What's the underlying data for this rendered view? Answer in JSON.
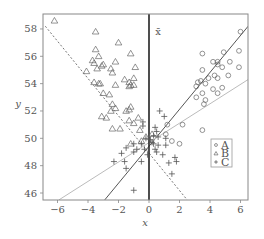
{
  "chart_data": {
    "type": "scatter",
    "title": "",
    "xlabel": "x",
    "ylabel": "y",
    "xlim": [
      -6.8,
      6.5
    ],
    "ylim": [
      45.5,
      59.1
    ],
    "xticks": [
      -6,
      -4,
      -2,
      0,
      2,
      4,
      6
    ],
    "yticks": [
      46,
      48,
      50,
      52,
      54,
      56,
      58
    ],
    "grid": false,
    "legend_position": "lower right",
    "annotation": {
      "text": "x̄",
      "x": 0.6,
      "y": 57.8
    },
    "vertical_line": {
      "x": 0,
      "style": "solid-thick"
    },
    "series": [
      {
        "name": "A",
        "marker": "circle",
        "points": [
          [
            6.0,
            57.8
          ],
          [
            3.5,
            56.2
          ],
          [
            4.9,
            56.3
          ],
          [
            5.9,
            56.4
          ],
          [
            4.2,
            55.6
          ],
          [
            4.5,
            55.6
          ],
          [
            5.3,
            55.6
          ],
          [
            4.5,
            55.4
          ],
          [
            5.9,
            55.2
          ],
          [
            3.5,
            55.0
          ],
          [
            4.8,
            55.2
          ],
          [
            4.3,
            54.6
          ],
          [
            4.5,
            54.4
          ],
          [
            5.2,
            54.6
          ],
          [
            3.9,
            54.4
          ],
          [
            3.2,
            54.1
          ],
          [
            3.4,
            54.2
          ],
          [
            3.7,
            54.0
          ],
          [
            3.1,
            53.8
          ],
          [
            4.2,
            53.6
          ],
          [
            3.5,
            53.3
          ],
          [
            4.8,
            53.7
          ],
          [
            4.5,
            53.3
          ],
          [
            3.1,
            53.0
          ],
          [
            3.7,
            52.8
          ],
          [
            3.6,
            52.5
          ],
          [
            1.2,
            51.0
          ],
          [
            2.2,
            51.0
          ],
          [
            1.1,
            50.3
          ],
          [
            3.5,
            50.6
          ],
          [
            1.5,
            49.8
          ],
          [
            2.0,
            49.6
          ]
        ]
      },
      {
        "name": "B",
        "marker": "triangle",
        "points": [
          [
            -6.2,
            58.6
          ],
          [
            -3.5,
            57.8
          ],
          [
            -3.5,
            56.5
          ],
          [
            -2.0,
            57.0
          ],
          [
            -1.2,
            56.2
          ],
          [
            -3.3,
            56.0
          ],
          [
            -3.7,
            55.7
          ],
          [
            -3.6,
            55.5
          ],
          [
            -3.1,
            55.3
          ],
          [
            -3.0,
            55.4
          ],
          [
            -2.2,
            55.6
          ],
          [
            -0.9,
            55.2
          ],
          [
            -4.1,
            54.9
          ],
          [
            -3.4,
            55.1
          ],
          [
            -2.5,
            55.1
          ],
          [
            -2.4,
            54.8
          ],
          [
            -1.6,
            54.3
          ],
          [
            -1.3,
            54.1
          ],
          [
            -1.0,
            54.4
          ],
          [
            -3.6,
            54.1
          ],
          [
            -3.3,
            54.0
          ],
          [
            -3.2,
            54.0
          ],
          [
            -2.2,
            53.9
          ],
          [
            -1.2,
            53.9
          ],
          [
            -1.3,
            53.8
          ],
          [
            -1.0,
            53.9
          ],
          [
            -3.0,
            53.3
          ],
          [
            -2.6,
            53.2
          ],
          [
            -2.4,
            52.5
          ],
          [
            -1.2,
            52.3
          ],
          [
            -1.3,
            52.1
          ],
          [
            -2.2,
            52.2
          ],
          [
            -2.5,
            52.0
          ],
          [
            -1.5,
            52.0
          ],
          [
            -3.1,
            51.6
          ],
          [
            -2.8,
            51.5
          ],
          [
            -0.7,
            51.5
          ],
          [
            -1.3,
            51.3
          ],
          [
            -1.0,
            51.1
          ],
          [
            -0.6,
            50.6
          ],
          [
            -2.4,
            50.7
          ],
          [
            -1.9,
            50.7
          ],
          [
            -0.2,
            50.1
          ],
          [
            0.2,
            50.3
          ],
          [
            -0.5,
            49.8
          ],
          [
            -1.2,
            49.6
          ]
        ]
      },
      {
        "name": "C",
        "marker": "plus",
        "points": [
          [
            1.0,
            51.6
          ],
          [
            0.7,
            52.0
          ],
          [
            -0.4,
            51.2
          ],
          [
            -0.4,
            50.9
          ],
          [
            0.4,
            50.8
          ],
          [
            0.5,
            50.5
          ],
          [
            0.3,
            50.2
          ],
          [
            1.1,
            50.0
          ],
          [
            -0.2,
            50.0
          ],
          [
            0.1,
            49.9
          ],
          [
            -1.0,
            49.6
          ],
          [
            -0.5,
            49.6
          ],
          [
            0.3,
            49.6
          ],
          [
            0.6,
            49.5
          ],
          [
            1.1,
            49.5
          ],
          [
            -1.5,
            49.3
          ],
          [
            -0.8,
            49.2
          ],
          [
            -0.3,
            49.2
          ],
          [
            0.4,
            49.2
          ],
          [
            0.5,
            49.0
          ],
          [
            -1.8,
            48.9
          ],
          [
            -1.0,
            49.0
          ],
          [
            -0.1,
            48.8
          ],
          [
            0.9,
            48.8
          ],
          [
            -1.6,
            48.3
          ],
          [
            -2.3,
            48.3
          ],
          [
            -0.5,
            48.3
          ],
          [
            1.3,
            48.2
          ],
          [
            1.8,
            48.3
          ],
          [
            -1.5,
            47.8
          ],
          [
            -1.0,
            46.2
          ],
          [
            1.5,
            47.4
          ],
          [
            1.7,
            48.6
          ],
          [
            0.2,
            49.7
          ],
          [
            0.6,
            50.1
          ]
        ]
      }
    ],
    "lines": [
      {
        "name": "trend-dashed",
        "style": "dashed",
        "color": "#777777",
        "from": [
          -6.8,
          58.2
        ],
        "to": [
          2.5,
          45.5
        ]
      },
      {
        "name": "trend-solid",
        "style": "solid",
        "color": "#555555",
        "from": [
          -2.9,
          45.5
        ],
        "to": [
          6.5,
          58.2
        ]
      },
      {
        "name": "trend-light",
        "style": "solid",
        "color": "#bbbbbb",
        "from": [
          -5.9,
          45.5
        ],
        "to": [
          6.5,
          54.3
        ]
      }
    ],
    "legend": [
      {
        "label": "A",
        "marker": "circle"
      },
      {
        "label": "B",
        "marker": "triangle"
      },
      {
        "label": "C",
        "marker": "plus"
      }
    ]
  }
}
